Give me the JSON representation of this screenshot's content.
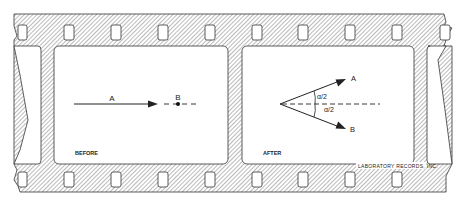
{
  "figure": {
    "type": "film-strip diagram",
    "frames": [
      {
        "caption": "BEFORE",
        "vector_a_label": "A",
        "point_b_label": "B"
      },
      {
        "caption": "AFTER",
        "vector_a_label": "A",
        "vector_b_label": "B",
        "angle_label_upper": "α/2",
        "angle_label_lower": "α/2"
      }
    ],
    "credit": "LABORATORY RECORDS, INC."
  },
  "colors": {
    "line": "#222222",
    "hatch": "#555555",
    "background": "#ffffff"
  }
}
